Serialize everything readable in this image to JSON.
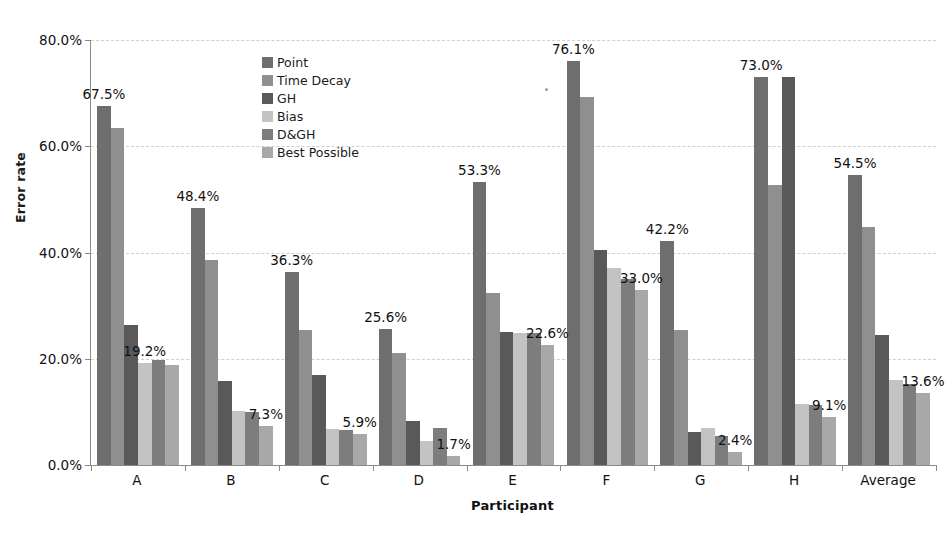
{
  "chart_data": {
    "type": "bar",
    "title": "",
    "xlabel": "Participant",
    "ylabel": "Error rate",
    "ylim": [
      0,
      80
    ],
    "ytick_values": [
      0,
      20,
      40,
      60,
      80
    ],
    "ytick_labels": [
      "0.0%",
      "20.0%",
      "40.0%",
      "60.0%",
      "80.0%"
    ],
    "grid": true,
    "grid_axis": "y",
    "grid_style": "dashed",
    "legend_position": "upper-left-inside",
    "categories": [
      "A",
      "B",
      "C",
      "D",
      "E",
      "F",
      "G",
      "H",
      "Average"
    ],
    "series": [
      {
        "name": "Point",
        "color": "#6e6e6e",
        "values": [
          67.5,
          48.4,
          36.3,
          25.6,
          53.3,
          76.1,
          42.2,
          73.0,
          54.5
        ]
      },
      {
        "name": "Time Decay",
        "color": "#8f8f8f",
        "values": [
          63.5,
          38.5,
          25.5,
          21.0,
          32.3,
          69.3,
          25.5,
          52.7,
          44.8
        ]
      },
      {
        "name": "GH",
        "color": "#595959",
        "values": [
          26.3,
          15.8,
          17.0,
          8.3,
          25.0,
          40.5,
          6.3,
          73.0,
          24.5
        ]
      },
      {
        "name": "Bias",
        "color": "#c3c3c3",
        "values": [
          19.2,
          10.2,
          6.8,
          4.5,
          24.9,
          37.0,
          7.0,
          11.5,
          16.0
        ]
      },
      {
        "name": "D&GH",
        "color": "#7d7d7d",
        "values": [
          19.8,
          10.0,
          6.5,
          7.0,
          24.8,
          35.0,
          5.5,
          11.3,
          15.2
        ]
      },
      {
        "name": "Best Possible",
        "color": "#a8a8a8",
        "values": [
          18.8,
          7.3,
          5.9,
          1.7,
          22.6,
          33.0,
          2.4,
          9.1,
          13.6
        ]
      }
    ],
    "annotations": [
      {
        "text": "67.5%",
        "category": "A",
        "series": "Point",
        "value": 67.5
      },
      {
        "text": "19.2%",
        "category": "A",
        "series": "Bias",
        "value": 19.2
      },
      {
        "text": "48.4%",
        "category": "B",
        "series": "Point",
        "value": 48.4
      },
      {
        "text": "7.3%",
        "category": "B",
        "series": "Best Possible",
        "value": 7.3
      },
      {
        "text": "36.3%",
        "category": "C",
        "series": "Point",
        "value": 36.3
      },
      {
        "text": "5.9%",
        "category": "C",
        "series": "Best Possible",
        "value": 5.9
      },
      {
        "text": "25.6%",
        "category": "D",
        "series": "Point",
        "value": 25.6
      },
      {
        "text": "1.7%",
        "category": "D",
        "series": "Best Possible",
        "value": 1.7
      },
      {
        "text": "53.3%",
        "category": "E",
        "series": "Point",
        "value": 53.3
      },
      {
        "text": "22.6%",
        "category": "E",
        "series": "Best Possible",
        "value": 22.6
      },
      {
        "text": "76.1%",
        "category": "F",
        "series": "Point",
        "value": 76.1
      },
      {
        "text": "33.0%",
        "category": "F",
        "series": "Best Possible",
        "value": 33.0
      },
      {
        "text": "42.2%",
        "category": "G",
        "series": "Point",
        "value": 42.2
      },
      {
        "text": "2.4%",
        "category": "G",
        "series": "Best Possible",
        "value": 2.4
      },
      {
        "text": "73.0%",
        "category": "H",
        "series": "Point",
        "value": 73.0
      },
      {
        "text": "9.1%",
        "category": "H",
        "series": "Best Possible",
        "value": 9.1
      },
      {
        "text": "54.5%",
        "category": "Average",
        "series": "Point",
        "value": 54.5
      },
      {
        "text": "13.6%",
        "category": "Average",
        "series": "Best Possible",
        "value": 13.6
      }
    ]
  },
  "legend": {
    "items": [
      {
        "label": "Point",
        "color": "#6e6e6e"
      },
      {
        "label": "Time Decay",
        "color": "#8f8f8f"
      },
      {
        "label": "GH",
        "color": "#595959"
      },
      {
        "label": "Bias",
        "color": "#c3c3c3"
      },
      {
        "label": "D&GH",
        "color": "#7d7d7d"
      },
      {
        "label": "Best Possible",
        "color": "#a8a8a8"
      }
    ]
  },
  "axes": {
    "y_title": "Error rate",
    "x_title": "Participant"
  }
}
